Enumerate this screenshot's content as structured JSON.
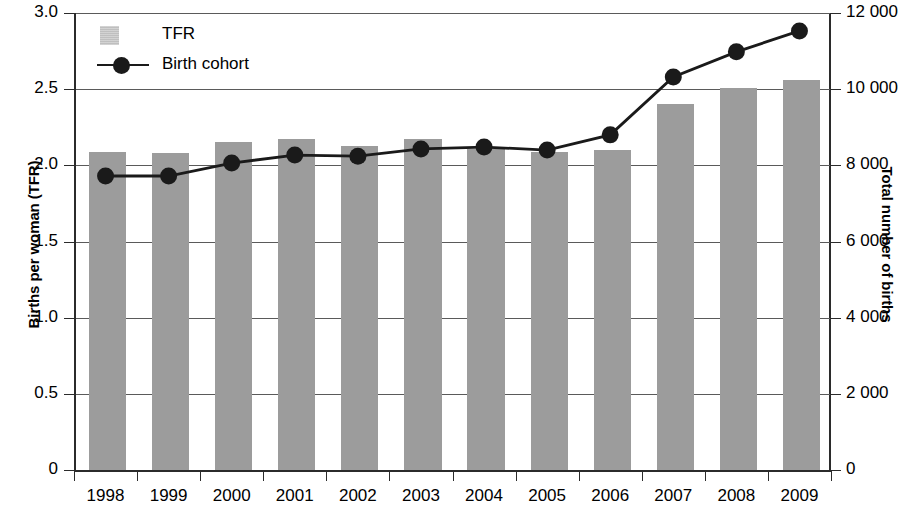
{
  "chart_data": {
    "type": "bar",
    "title": "",
    "categories": [
      "1998",
      "1999",
      "2000",
      "2001",
      "2002",
      "2003",
      "2004",
      "2005",
      "2006",
      "2007",
      "2008",
      "2009"
    ],
    "xlabel": "",
    "ylabel": "Births per woman (TFR)",
    "ylabel_secondary": "Total number of births",
    "ylim": [
      0,
      3.0
    ],
    "ylim_secondary": [
      0,
      12000
    ],
    "yticks": [
      0,
      0.5,
      1.0,
      1.5,
      2.0,
      2.5,
      3.0
    ],
    "ytick_labels": [
      "0",
      "0.5",
      "1.0",
      "1.5",
      "2.0",
      "2.5",
      "3.0"
    ],
    "yticks_secondary": [
      0,
      2000,
      4000,
      6000,
      8000,
      10000,
      12000
    ],
    "ytick_labels_secondary": [
      "0",
      "2 000",
      "4 000",
      "6 000",
      "8 000",
      "10 000",
      "12 000"
    ],
    "grid": true,
    "legend_position": "top-left",
    "series": [
      {
        "name": "TFR",
        "type": "bar",
        "axis": "left",
        "color": "#9c9c9c",
        "values": [
          2.09,
          2.08,
          2.15,
          2.17,
          2.13,
          2.17,
          2.11,
          2.09,
          2.1,
          2.4,
          2.51,
          2.56
        ]
      },
      {
        "name": "Birth cohort",
        "type": "line",
        "axis": "right",
        "color": "#1a1a1a",
        "values": [
          7720,
          7720,
          8060,
          8270,
          8240,
          8430,
          8480,
          8400,
          8800,
          10320,
          10980,
          11530
        ]
      }
    ]
  },
  "legend": {
    "items": [
      {
        "label": "TFR",
        "marker": "square-swatch"
      },
      {
        "label": "Birth cohort",
        "marker": "line-with-dot"
      }
    ]
  },
  "axes": {
    "left_title": "Births per woman (TFR)",
    "right_title": "Total number of births"
  }
}
